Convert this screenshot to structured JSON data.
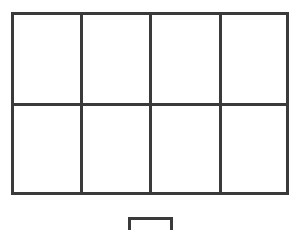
{
  "diagram": {
    "grid": {
      "rows": 2,
      "columns": 4,
      "cells": 8
    },
    "small_box": {
      "position": "below grid, horizontally centered",
      "count": 1
    },
    "line_color": "#3a3a3a",
    "background_color": "#ffffff"
  }
}
